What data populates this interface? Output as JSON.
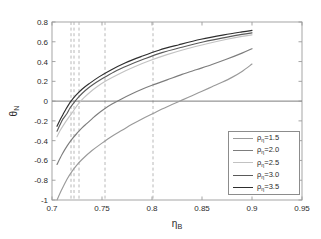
{
  "chart_data": {
    "type": "line",
    "title": "",
    "xlabel": "η_B",
    "ylabel": "θ_N",
    "xlim": [
      0.7,
      0.95
    ],
    "ylim": [
      -1.0,
      0.8
    ],
    "xticks": [
      "0.7",
      "0.75",
      "0.8",
      "0.85",
      "0.9",
      "0.95"
    ],
    "xtick_values": [
      0.7,
      0.75,
      0.8,
      0.85,
      0.9,
      0.95
    ],
    "yticks": [
      "0.8",
      "0.6",
      "0.4",
      "0.2",
      "0",
      "-0.2",
      "-0.4",
      "-0.6",
      "-0.8",
      "-1"
    ],
    "ytick_values": [
      0.8,
      0.6,
      0.4,
      0.2,
      0,
      -0.2,
      -0.4,
      -0.6,
      -0.8,
      -1.0
    ],
    "grid": false,
    "legend_position": "lower right",
    "zero_line": 0,
    "series": [
      {
        "name": "ρ_η=1.5",
        "color": "#9a9a9a",
        "zero_crossing": 0.801,
        "x": [
          0.705,
          0.71,
          0.715,
          0.72,
          0.725,
          0.73,
          0.74,
          0.75,
          0.76,
          0.77,
          0.78,
          0.79,
          0.801,
          0.81,
          0.82,
          0.83,
          0.84,
          0.85,
          0.86,
          0.87,
          0.88,
          0.89,
          0.9
        ],
        "y": [
          -1.0,
          -0.89,
          -0.79,
          -0.71,
          -0.645,
          -0.59,
          -0.5,
          -0.425,
          -0.355,
          -0.295,
          -0.235,
          -0.18,
          -0.125,
          -0.08,
          -0.035,
          0.01,
          0.055,
          0.1,
          0.145,
          0.19,
          0.24,
          0.3,
          0.375
        ]
      },
      {
        "name": "ρ_η=2.0",
        "color": "#7d7d7d",
        "zero_crossing": 0.753,
        "x": [
          0.705,
          0.71,
          0.715,
          0.72,
          0.725,
          0.73,
          0.735,
          0.74,
          0.745,
          0.753,
          0.76,
          0.77,
          0.78,
          0.79,
          0.8,
          0.815,
          0.83,
          0.845,
          0.86,
          0.875,
          0.89,
          0.9
        ],
        "y": [
          -0.64,
          -0.54,
          -0.455,
          -0.385,
          -0.325,
          -0.27,
          -0.225,
          -0.18,
          -0.135,
          -0.075,
          -0.03,
          0.025,
          0.075,
          0.12,
          0.16,
          0.215,
          0.27,
          0.32,
          0.37,
          0.425,
          0.485,
          0.53
        ]
      },
      {
        "name": "ρ_η=2.5",
        "color": "#c2c2c2",
        "zero_crossing": 0.727,
        "x": [
          0.705,
          0.708,
          0.712,
          0.716,
          0.72,
          0.723,
          0.727,
          0.732,
          0.738,
          0.745,
          0.755,
          0.768,
          0.782,
          0.798,
          0.815,
          0.835,
          0.855,
          0.875,
          0.89,
          0.9
        ],
        "y": [
          -0.36,
          -0.3,
          -0.235,
          -0.175,
          -0.12,
          -0.075,
          -0.02,
          0.035,
          0.09,
          0.145,
          0.21,
          0.28,
          0.345,
          0.41,
          0.47,
          0.53,
          0.58,
          0.625,
          0.655,
          0.67
        ]
      },
      {
        "name": "ρ_η=3.0",
        "color": "#5a5a5a",
        "zero_crossing": 0.722,
        "x": [
          0.705,
          0.708,
          0.711,
          0.715,
          0.718,
          0.722,
          0.727,
          0.733,
          0.74,
          0.75,
          0.762,
          0.776,
          0.792,
          0.81,
          0.83,
          0.852,
          0.874,
          0.89,
          0.9
        ],
        "y": [
          -0.305,
          -0.24,
          -0.18,
          -0.125,
          -0.07,
          -0.015,
          0.045,
          0.105,
          0.16,
          0.225,
          0.295,
          0.36,
          0.425,
          0.49,
          0.545,
          0.6,
          0.645,
          0.675,
          0.69
        ]
      },
      {
        "name": "ρ_η=3.5",
        "color": "#2e2e2e",
        "zero_crossing": 0.719,
        "x": [
          0.705,
          0.708,
          0.711,
          0.714,
          0.717,
          0.719,
          0.724,
          0.73,
          0.737,
          0.747,
          0.759,
          0.773,
          0.789,
          0.807,
          0.827,
          0.849,
          0.872,
          0.89,
          0.9
        ],
        "y": [
          -0.255,
          -0.19,
          -0.135,
          -0.08,
          -0.03,
          0.0,
          0.06,
          0.12,
          0.175,
          0.245,
          0.315,
          0.385,
          0.45,
          0.515,
          0.57,
          0.625,
          0.67,
          0.7,
          0.715
        ]
      }
    ],
    "vlines": {
      "style": "dashed",
      "color": "#b0b0b0",
      "values": [
        0.719,
        0.722,
        0.727,
        0.753,
        0.801
      ]
    }
  },
  "axes": {
    "x_label_main": "η",
    "x_label_sub": "B",
    "y_label_main": "θ",
    "y_label_sub": "N"
  },
  "legend": {
    "entries": [
      {
        "rho": "ρ",
        "sub": "η",
        "value": "=1.5"
      },
      {
        "rho": "ρ",
        "sub": "η",
        "value": "=2.0"
      },
      {
        "rho": "ρ",
        "sub": "η",
        "value": "=2.5"
      },
      {
        "rho": "ρ",
        "sub": "η",
        "value": "=3.0"
      },
      {
        "rho": "ρ",
        "sub": "η",
        "value": "=3.5"
      }
    ]
  }
}
